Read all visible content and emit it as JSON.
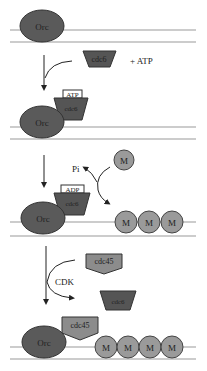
{
  "diagram": {
    "labels": {
      "orc": "Orc",
      "cdc6": "cdc6",
      "atp_plus": "+ ATP",
      "atp": "ATP",
      "adp": "ADP",
      "pi": "Pi",
      "mcm": "M",
      "cdk": "CDK",
      "cdc45": "cdc45"
    },
    "colors": {
      "orc": "#5a5a5a",
      "cdc6": "#555555",
      "mcm": "#9a9a9a",
      "cdc45": "#8c8c8c",
      "dna": "#999999",
      "arrow": "#222222"
    },
    "steps": [
      {
        "stage": 1,
        "description": "Orc bound to DNA; free cdc6 + ATP"
      },
      {
        "stage": 2,
        "description": "cdc6-ATP bound to Orc; free M"
      },
      {
        "stage": 3,
        "description": "ADP-cdc6 on Orc, Pi released, M M M loaded"
      },
      {
        "stage": 4,
        "description": "CDK: cdc45 replaces cdc6; M M M M on DNA"
      }
    ]
  }
}
